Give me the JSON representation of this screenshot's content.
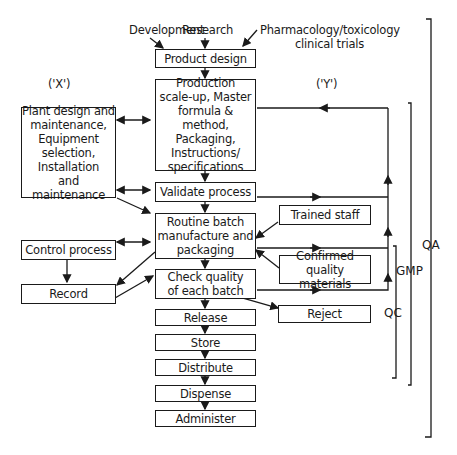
{
  "inputs": {
    "development": "Development",
    "research": "Research",
    "pharmacology_line1": "Pharmacology/toxicology",
    "pharmacology_line2": "clinical trials"
  },
  "markers": {
    "x": "('X')",
    "y": "('Y')"
  },
  "main_flow": {
    "product_design": "Product design",
    "production": [
      "Production",
      "scale-up, Master",
      "formula & method,",
      "Packaging,",
      "Instructions/",
      "specifications"
    ],
    "validate": "Validate process",
    "routine": [
      "Routine batch",
      "manufacture and",
      "packaging"
    ],
    "check": [
      "Check quality",
      "of each batch"
    ],
    "release": "Release",
    "store": "Store",
    "distribute": "Distribute",
    "dispense": "Dispense",
    "administer": "Administer"
  },
  "left_side": {
    "plant": [
      "Plant design and",
      "maintenance,",
      "Equipment",
      "selection,",
      "Installation",
      "and maintenance"
    ],
    "control": "Control process",
    "record": "Record"
  },
  "right_side": {
    "trained_staff": "Trained staff",
    "confirmed": [
      "Confirmed quality",
      "materials"
    ],
    "reject": "Reject"
  },
  "brackets": {
    "qa": "QA",
    "gmp": "GMP",
    "qc": "QC"
  }
}
